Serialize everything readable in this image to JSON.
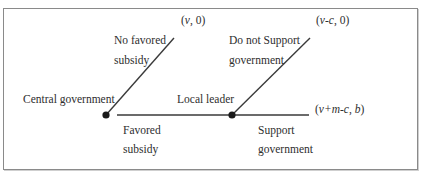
{
  "diagram": {
    "type": "game-tree",
    "colors": {
      "line": "#3a3a3a",
      "node": "#1a1a1a",
      "border": "#8a8a8a"
    },
    "nodes": [
      {
        "id": "central",
        "label": "Central government"
      },
      {
        "id": "local",
        "label": "Local leader"
      }
    ],
    "branches": {
      "central_up": {
        "line1": "No favored",
        "line2": "subsidy"
      },
      "central_right": {
        "line1": "Favored",
        "line2": "subsidy"
      },
      "local_up": {
        "line1": "Do not Support",
        "line2": "government"
      },
      "local_right": {
        "line1": "Support",
        "line2": "government"
      }
    },
    "payoffs": {
      "no_favored": {
        "open": "(",
        "a": "v",
        "sep": ", ",
        "b": "0",
        "close": ")"
      },
      "not_support": {
        "open": "(",
        "a": "v-c",
        "sep": ", ",
        "b": "0",
        "close": ")"
      },
      "support": {
        "open": "(",
        "a": "v+m-c",
        "sep": ", ",
        "b": "b",
        "close": ")"
      }
    }
  }
}
